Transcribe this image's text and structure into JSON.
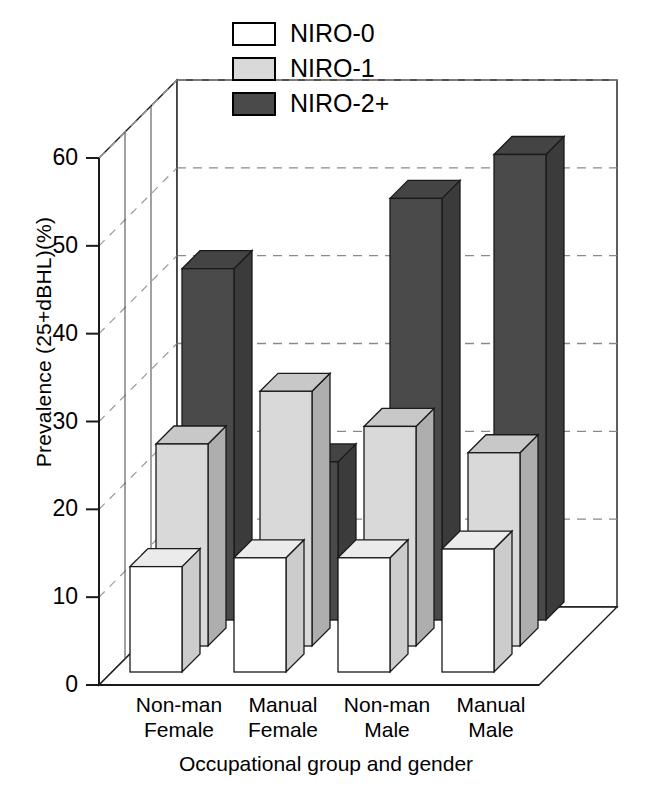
{
  "chart_data": {
    "type": "bar",
    "title": "",
    "subtitle": "",
    "xlabel": "Occupational group and gender",
    "ylabel": "Prevalence (25+dBHL)(%)",
    "ylim": [
      0,
      60
    ],
    "yticks": [
      0,
      10,
      20,
      30,
      40,
      50,
      60
    ],
    "ytick_labels": [
      "0",
      "10",
      "20",
      "30",
      "40",
      "50",
      "60"
    ],
    "grid": true,
    "grid_style": "dashed",
    "projection": "3d-grouped-rows",
    "legend_position": "top-center",
    "categories": [
      "Non-man Female",
      "Manual Female",
      "Non-man Male",
      "Manual Male"
    ],
    "category_lines": [
      [
        "Non-man",
        "Female"
      ],
      [
        "Manual",
        "Female"
      ],
      [
        "Non-man",
        "Male"
      ],
      [
        "Manual",
        "Male"
      ]
    ],
    "series": [
      {
        "name": "NIRO-0",
        "color": "#ffffff",
        "values": [
          12,
          13,
          13,
          14
        ]
      },
      {
        "name": "NIRO-1",
        "color": "#d9d9d9",
        "values": [
          23,
          29,
          25,
          22
        ]
      },
      {
        "name": "NIRO-2+",
        "color": "#4a4a4a",
        "values": [
          40,
          18,
          48,
          53
        ]
      }
    ]
  },
  "legend": {
    "items": [
      {
        "label": "NIRO-0",
        "swatch": "#ffffff"
      },
      {
        "label": "NIRO-1",
        "swatch": "#d9d9d9"
      },
      {
        "label": "NIRO-2+",
        "swatch": "#4a4a4a"
      }
    ]
  },
  "colors": {
    "axis": "#1a1a1a",
    "grid": "#888888",
    "series_0": "#ffffff",
    "series_1": "#d9d9d9",
    "series_2": "#4a4a4a",
    "background": "#ffffff"
  }
}
